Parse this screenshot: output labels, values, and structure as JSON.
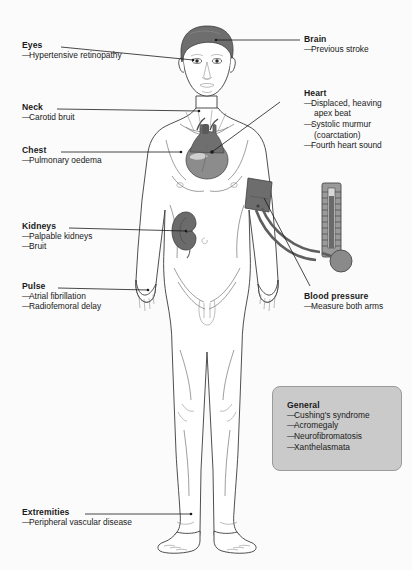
{
  "diagram": {
    "type": "annotated-human-body-diagram",
    "background_color": "#fbfbfb",
    "figure": {
      "subject": "male-anatomical-figure",
      "organs_shown": [
        "brain",
        "heart",
        "kidney",
        "blood-pressure-cuff",
        "sphygmomanometer"
      ],
      "colors": {
        "skin_outline": "#3b3b3b",
        "hair": "#6e6e6e",
        "heart": "#8c8c8c",
        "heart_dark": "#5f5f5f",
        "kidney": "#6b6b6b",
        "cuff": "#6d6d6d",
        "manometer": "#9a9a9a",
        "bulb": "#8a8a8a"
      }
    }
  },
  "labels": {
    "eyes": {
      "title": "Eyes",
      "items": [
        "Hypertensive retinopathy"
      ]
    },
    "neck": {
      "title": "Neck",
      "items": [
        "Carotid bruit"
      ]
    },
    "chest": {
      "title": "Chest",
      "items": [
        "Pulmonary oedema"
      ]
    },
    "kidneys": {
      "title": "Kidneys",
      "items": [
        "Palpable kidneys",
        "Bruit"
      ]
    },
    "pulse": {
      "title": "Pulse",
      "items": [
        "Atrial fibrillation",
        "Radiofemoral delay"
      ]
    },
    "extremities": {
      "title": "Extremities",
      "items": [
        "Peripheral vascular disease"
      ]
    },
    "brain": {
      "title": "Brain",
      "items": [
        "Previous stroke"
      ]
    },
    "heart": {
      "title": "Heart",
      "items": [
        "Displaced, heaving",
        "apex beat",
        "Systolic murmur",
        "(coarctation)",
        "Fourth heart sound"
      ],
      "item_lines": [
        {
          "text": "Displaced, heaving",
          "dash": true
        },
        {
          "text": "apex beat",
          "dash": false
        },
        {
          "text": "Systolic murmur",
          "dash": true
        },
        {
          "text": "(coarctation)",
          "dash": false
        },
        {
          "text": "Fourth heart sound",
          "dash": true
        }
      ]
    },
    "blood_pressure": {
      "title": "Blood pressure",
      "items": [
        "Measure both arms"
      ]
    },
    "general": {
      "title": "General",
      "items": [
        "Cushing's syndrome",
        "Acromegaly",
        "Neurofibromatosis",
        "Xanthelasmata"
      ]
    }
  }
}
